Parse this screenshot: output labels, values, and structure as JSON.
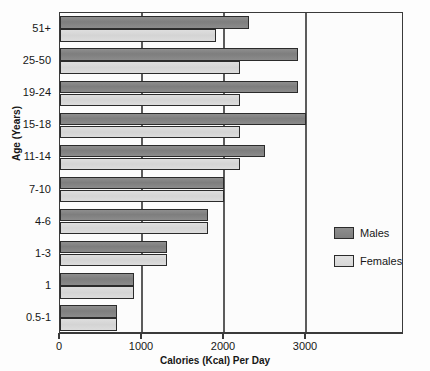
{
  "chart_data": {
    "type": "bar",
    "orientation": "horizontal",
    "title": "",
    "xlabel": "Calories (Kcal) Per Day",
    "ylabel": "Age (Years)",
    "categories": [
      "0.5-1",
      "1",
      "1-3",
      "4-6",
      "7-10",
      "11-14",
      "15-18",
      "19-24",
      "25-50",
      "51+"
    ],
    "series": [
      {
        "name": "Males",
        "color": "#8a8a8a",
        "values": [
          700,
          900,
          1300,
          1800,
          2000,
          2500,
          3000,
          2900,
          2900,
          2300
        ]
      },
      {
        "name": "Females",
        "color": "#d8d8d8",
        "values": [
          700,
          900,
          1300,
          1800,
          2000,
          2200,
          2200,
          2200,
          2200,
          1900
        ]
      }
    ],
    "xticks": [
      0,
      1000,
      2000,
      3000
    ],
    "xtick_labels": [
      "0",
      "1000",
      "2000",
      "3000"
    ],
    "xlim": [
      0,
      4195
    ],
    "grid": "vertical",
    "legend_position": "right"
  },
  "legend": {
    "entries": [
      {
        "label": "Males",
        "swatch": "male-swatch"
      },
      {
        "label": "Females",
        "swatch": "female-swatch"
      }
    ]
  },
  "axes": {
    "y_title": "Age (Years)",
    "x_title": "Calories (Kcal) Per Day"
  }
}
